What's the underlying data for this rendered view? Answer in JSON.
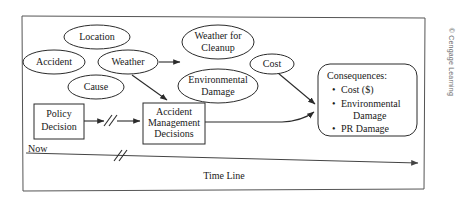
{
  "figure": {
    "title_vertical_credit": "© Cengage Learning",
    "frame": {
      "x": 22,
      "y": 15,
      "width": 403,
      "height": 175
    }
  },
  "colors": {
    "background": "#ffffff",
    "shape_fill": "#ffffff",
    "shape_stroke": "#2b2b2b",
    "frame_stroke": "#555555",
    "text": "#1a1a1a",
    "credit_text": "#6b6b6b"
  },
  "nodes": {
    "ellipses": [
      {
        "id": "location",
        "label": "Location",
        "lines": [
          "Location"
        ],
        "cx": 97,
        "cy": 37,
        "rx": 33,
        "ry": 12,
        "font_size": 10
      },
      {
        "id": "accident",
        "label": "Accident",
        "lines": [
          "Accident"
        ],
        "cx": 54,
        "cy": 62,
        "rx": 31,
        "ry": 12,
        "font_size": 10
      },
      {
        "id": "weather",
        "label": "Weather",
        "lines": [
          "Weather"
        ],
        "cx": 128,
        "cy": 62,
        "rx": 30,
        "ry": 12,
        "font_size": 10
      },
      {
        "id": "cause",
        "label": "Cause",
        "lines": [
          "Cause"
        ],
        "cx": 96,
        "cy": 87,
        "rx": 28,
        "ry": 12,
        "font_size": 10
      },
      {
        "id": "weather-for-cleanup",
        "label": "Weather for Cleanup",
        "lines": [
          "Weather for",
          "Cleanup"
        ],
        "cx": 218,
        "cy": 42,
        "rx": 36,
        "ry": 17,
        "font_size": 10
      },
      {
        "id": "environmental-damage",
        "label": "Environmental Damage",
        "lines": [
          "Environmental",
          "Damage"
        ],
        "cx": 218,
        "cy": 86,
        "rx": 40,
        "ry": 17,
        "font_size": 10
      },
      {
        "id": "cost",
        "label": "Cost",
        "lines": [
          "Cost"
        ],
        "cx": 272,
        "cy": 64,
        "rx": 22,
        "ry": 10,
        "font_size": 10
      }
    ],
    "boxes": [
      {
        "id": "policy-decision",
        "label": "Policy Decision",
        "lines": [
          "Policy",
          "Decision"
        ],
        "x": 34,
        "y": 104,
        "width": 50,
        "height": 35,
        "font_size": 10,
        "rounded": 0
      },
      {
        "id": "accident-management-decisions",
        "label": "Accident Management Decisions",
        "lines": [
          "Accident",
          "Management",
          "Decisions"
        ],
        "x": 143,
        "y": 103,
        "width": 62,
        "height": 41,
        "font_size": 10,
        "rounded": 0
      }
    ],
    "consequences": {
      "id": "consequences",
      "heading": "Consequences:",
      "bullets": [
        "Cost ($)",
        "Environmental",
        "Damage",
        "PR Damage"
      ],
      "bullet_lines": [
        {
          "text": "Cost ($)",
          "bullet": true
        },
        {
          "text": "Environmental",
          "bullet": true
        },
        {
          "text": "Damage",
          "bullet": false
        },
        {
          "text": "PR Damage",
          "bullet": true
        }
      ],
      "x": 318,
      "y": 64,
      "width": 99,
      "height": 72,
      "font_size": 10,
      "rounded": 12
    }
  },
  "labels": {
    "now": "Now",
    "time_line": "Time Line"
  },
  "timeline": {
    "start_x": 26,
    "start_y": 153,
    "end_x": 421,
    "end_y": 163,
    "break_x": 118
  },
  "icons": {
    "arrowhead": "arrowhead-icon",
    "break_mark": "double-slash-break-icon"
  }
}
